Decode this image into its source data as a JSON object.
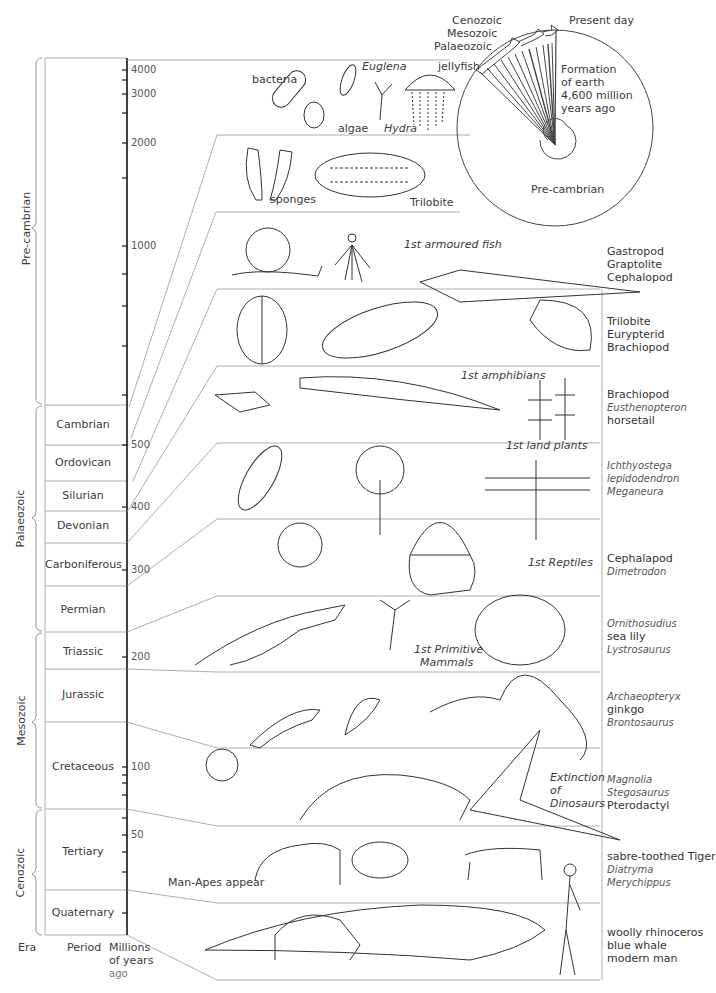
{
  "columns": {
    "era": "Era",
    "period": "Period",
    "mya_line1": "Millions",
    "mya_line2": "of years",
    "mya_line3": "ago"
  },
  "eras": [
    {
      "name": "Pre-cambrian"
    },
    {
      "name": "Palaeozoic"
    },
    {
      "name": "Mesozoic"
    },
    {
      "name": "Cenozoic"
    }
  ],
  "periods": [
    {
      "name": "Cambrian"
    },
    {
      "name": "Ordovican"
    },
    {
      "name": "Silurian"
    },
    {
      "name": "Devonian"
    },
    {
      "name": "Carboniferous"
    },
    {
      "name": "Permian"
    },
    {
      "name": "Triassic"
    },
    {
      "name": "Jurassic"
    },
    {
      "name": "Cretaceous"
    },
    {
      "name": "Tertiary"
    },
    {
      "name": "Quaternary"
    }
  ],
  "axis_ticks": [
    "4000",
    "3000",
    "2000",
    "1000",
    "500",
    "400",
    "300",
    "200",
    "100",
    "50"
  ],
  "clock": {
    "cenozoic": "Cenozoic",
    "mesozoic": "Mesozoic",
    "palaeozoic": "Palaeozoic",
    "present_day": "Present day",
    "formation_1": "Formation",
    "formation_2": "of earth",
    "formation_3": "4,600 million",
    "formation_4": "years ago",
    "precambrian": "Pre-cambrian"
  },
  "panel_labels": {
    "bacteria": "bacteria",
    "euglena": "Euglena",
    "jellyfish": "jellyfish",
    "algae": "algae",
    "hydra": "Hydra",
    "sponges": "sponges",
    "trilobite": "Trilobite",
    "armoured_fish": "1st armoured fish",
    "amphibians": "1st amphibians",
    "land_plants": "1st land plants",
    "reptiles": "1st Reptiles",
    "primitive_mammals_1": "1st Primitive",
    "primitive_mammals_2": "Mammals",
    "extinction_1": "Extinction",
    "extinction_2": "of",
    "extinction_3": "Dinosaurs",
    "man_apes": "Man-Apes appear"
  },
  "side_lists": [
    {
      "items": [
        {
          "t": "Gastropod"
        },
        {
          "t": "Graptolite"
        },
        {
          "t": "Cephalopod"
        }
      ]
    },
    {
      "items": [
        {
          "t": "Trilobite"
        },
        {
          "t": "Eurypterid"
        },
        {
          "t": "Brachiopod"
        }
      ]
    },
    {
      "items": [
        {
          "t": "Brachiopod"
        },
        {
          "t": "Eusthenopteron"
        },
        {
          "t": "horsetail"
        }
      ]
    },
    {
      "items": [
        {
          "t": "Ichthyostega"
        },
        {
          "t": "lepidodendron"
        },
        {
          "t": "Meganeura"
        }
      ]
    },
    {
      "items": [
        {
          "t": "Cephalapod"
        },
        {
          "t": "Dimetrodon"
        }
      ]
    },
    {
      "items": [
        {
          "t": "Ornithosudius"
        },
        {
          "t": "sea lily"
        },
        {
          "t": "Lystrosaurus"
        }
      ]
    },
    {
      "items": [
        {
          "t": "Archaeopteryx"
        },
        {
          "t": "ginkgo"
        },
        {
          "t": "Brontosaurus"
        }
      ]
    },
    {
      "items": [
        {
          "t": "Magnolia"
        },
        {
          "t": "Stegosaurus"
        },
        {
          "t": "Pterodactyl"
        }
      ]
    },
    {
      "items": [
        {
          "t": "sabre-toothed Tiger"
        },
        {
          "t": "Diatryma"
        },
        {
          "t": "Merychippus"
        }
      ]
    },
    {
      "items": [
        {
          "t": "woolly rhinoceros"
        },
        {
          "t": "blue whale"
        },
        {
          "t": "modern man"
        }
      ]
    }
  ],
  "colors": {
    "line": "#888888",
    "axis": "#111111",
    "ink": "#333333"
  }
}
